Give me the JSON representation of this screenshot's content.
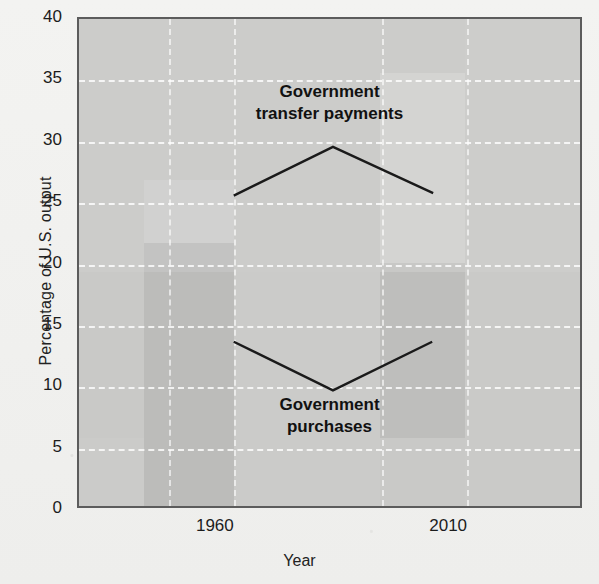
{
  "chart_data": {
    "type": "line",
    "title": "",
    "xlabel": "Year",
    "ylabel": "Percentage of U.S. output",
    "ylim": [
      0,
      40
    ],
    "ytick_labels": [
      "0",
      "5",
      "10",
      "15",
      "20",
      "25",
      "30",
      "35",
      "40"
    ],
    "ytick_values": [
      0,
      5,
      10,
      15,
      20,
      25,
      30,
      35,
      40
    ],
    "xtick_labels": [
      "1960",
      "2010"
    ],
    "xtick_positions_pct": [
      27.3,
      73.5
    ],
    "grid": "dashed-white",
    "legend": "inline-annotations",
    "series": [
      {
        "name": "Government transfer payments",
        "x_pct": [
          30.9,
          50.7,
          70.7
        ],
        "values": [
          25.5,
          29.5,
          25.7
        ]
      },
      {
        "name": "Government purchases",
        "x_pct": [
          30.9,
          50.7,
          70.5
        ],
        "values": [
          13.5,
          9.5,
          13.5
        ]
      }
    ],
    "annotations": [
      {
        "text_line1": "Government",
        "text_line2": "transfer payments"
      },
      {
        "text_line1": "Government",
        "text_line2": "purchases"
      }
    ],
    "vertical_gridlines_pct": [
      18,
      31,
      60.5,
      77.5
    ],
    "colors": {
      "plot_background": "#c9c9c7",
      "page_background": "#f2f2f0",
      "line": "#1a1a1a",
      "gridline": "#ffffff",
      "axis_border": "#5c5c5c",
      "text": "#1a1a1a"
    }
  },
  "axis": {
    "y_title": "Percentage of U.S. output",
    "x_title": "Year"
  },
  "series_labels": {
    "transfer_line1": "Government",
    "transfer_line2": "transfer payments",
    "purchases_line1": "Government",
    "purchases_line2": "purchases"
  }
}
